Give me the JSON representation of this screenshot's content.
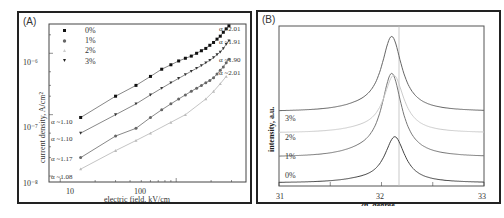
{
  "chart_data": [
    {
      "panel": "(A)",
      "type": "scatter",
      "xlabel": "electric field, kV/cm",
      "ylabel": "current density, A/cm²",
      "xscale": "log",
      "yscale": "log",
      "xlim": [
        8,
        400
      ],
      "ylim": [
        8e-09,
        3e-06
      ],
      "x_ticks": [
        "10",
        "100"
      ],
      "y_ticks": [
        "10⁻⁸",
        "10⁻⁷",
        "10⁻⁶"
      ],
      "legend": [
        "0%",
        "1%",
        "2%",
        "3%"
      ],
      "legend_position": "upper left",
      "series": [
        {
          "name": "0%",
          "marker": "square",
          "color": "#111111",
          "x": [
            15,
            30,
            45,
            60,
            75,
            90,
            105,
            120,
            135,
            150,
            165,
            180,
            195,
            210,
            225,
            240,
            255,
            270,
            285
          ],
          "y": [
            9e-08,
            2e-07,
            3e-07,
            4.2e-07,
            5.5e-07,
            6.5e-07,
            7.5e-07,
            8.3e-07,
            9e-07,
            1e-06,
            1.1e-06,
            1.2e-06,
            1.35e-06,
            1.5e-06,
            1.7e-06,
            1.9e-06,
            2.2e-06,
            2.5e-06,
            2.8e-06
          ],
          "slope_low": "α ~1.10",
          "slope_high": "α ~2.01"
        },
        {
          "name": "1%",
          "marker": "circle",
          "color": "#666666",
          "x": [
            15,
            30,
            45,
            60,
            75,
            90,
            105,
            120,
            135,
            150,
            165,
            180,
            195,
            210,
            225,
            240,
            255,
            270,
            285
          ],
          "y": [
            2e-08,
            4.5e-08,
            6e-08,
            9e-08,
            1.2e-07,
            1.5e-07,
            1.8e-07,
            2.1e-07,
            2.4e-07,
            2.7e-07,
            3e-07,
            3.3e-07,
            3.6e-07,
            4e-07,
            4.6e-07,
            5.3e-07,
            6e-07,
            7e-07,
            8e-07
          ],
          "slope_low": "α ~1.17",
          "slope_high": "α ~1.90"
        },
        {
          "name": "2%",
          "marker": "triangle-up",
          "color": "#bbbbbb",
          "x": [
            15,
            30,
            45,
            60,
            90,
            120,
            180,
            210,
            240,
            270
          ],
          "y": [
            1.3e-08,
            2.6e-08,
            3.8e-08,
            5e-08,
            7.5e-08,
            1e-07,
            1.8e-07,
            2.4e-07,
            3.2e-07,
            4.2e-07
          ],
          "slope_low": "α ~1.08",
          "slope_high": "α ~2.01"
        },
        {
          "name": "3%",
          "marker": "triangle-down",
          "color": "#333333",
          "x": [
            15,
            30,
            45,
            60,
            75,
            90,
            105,
            120,
            135,
            150,
            165,
            180,
            195,
            210,
            225,
            240,
            255,
            270,
            285
          ],
          "y": [
            5e-08,
            1e-07,
            1.5e-07,
            2.1e-07,
            2.7e-07,
            3.3e-07,
            3.9e-07,
            4.5e-07,
            5.1e-07,
            5.7e-07,
            6.3e-07,
            7e-07,
            7.7e-07,
            8.5e-07,
            9.5e-07,
            1.05e-06,
            1.2e-06,
            1.4e-06,
            1.6e-06
          ],
          "slope_low": "α ~1.10",
          "slope_high": "α ~1.91"
        }
      ],
      "annotations_left": [
        "α ~1.10",
        "α ~1.10",
        "α ~1.17",
        "α ~1.08"
      ],
      "annotations_right": [
        "α ~2.01",
        "α ~1.91",
        "α ~1.90",
        "α ~2.01"
      ],
      "grid": false
    },
    {
      "panel": "(B)",
      "type": "line",
      "xlabel": "2θ, degree",
      "ylabel": "intensity, a.u.",
      "xlim": [
        31,
        33
      ],
      "x_ticks": [
        "31",
        "32",
        "33"
      ],
      "reference_line_x": 32.13,
      "grid": false,
      "series": [
        {
          "name": "0%",
          "peak_x": 32.13,
          "baseline": 0.0,
          "peak_height": 0.32,
          "color": "#444444"
        },
        {
          "name": "1%",
          "peak_x": 32.1,
          "baseline": 0.18,
          "peak_height": 0.58,
          "color": "#777777"
        },
        {
          "name": "2%",
          "peak_x": 32.12,
          "baseline": 0.35,
          "peak_height": 0.4,
          "color": "#cccccc"
        },
        {
          "name": "3%",
          "peak_x": 32.1,
          "baseline": 0.5,
          "peak_height": 0.52,
          "color": "#666666"
        }
      ],
      "curve_labels": [
        "3%",
        "2%",
        "1%",
        "0%"
      ]
    }
  ],
  "panelA": {
    "label": "(A)",
    "xlabel": "electric field, kV/cm",
    "ylabel": "current density, A/cm²",
    "xticks": [
      "10",
      "100"
    ],
    "yticks": [
      "10⁻⁶",
      "10⁻⁷",
      "10⁻⁸"
    ],
    "legend": [
      "0%",
      "1%",
      "2%",
      "3%"
    ],
    "alpha_left": [
      "α ~1.10",
      "α ~1.10",
      "α ~1.17",
      "α ~1.08"
    ],
    "alpha_right": [
      "α ~2.01",
      "α ~1.91",
      "α ~1.90",
      "α ~2.01"
    ]
  },
  "panelB": {
    "label": "(B)",
    "xlabel": "2θ, degree",
    "ylabel": "intensity, a.u.",
    "xticks": [
      "31",
      "32",
      "33"
    ],
    "curve_labels": [
      "3%",
      "2%",
      "1%",
      "0%"
    ]
  }
}
